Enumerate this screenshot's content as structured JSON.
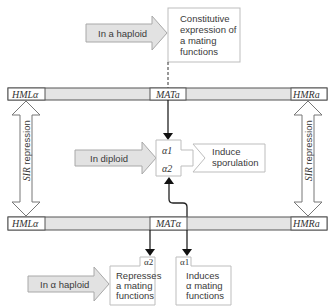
{
  "diagram": {
    "top_input": {
      "label": "In a haploid"
    },
    "top_output": {
      "lines": [
        "Constitutive",
        "expression of",
        "a mating",
        "functions"
      ]
    },
    "top_bar": {
      "left": "HMLα",
      "center": "MATa",
      "right": "HMRa"
    },
    "bottom_bar": {
      "left": "HMLα",
      "center": "MATα",
      "right": "HMRa"
    },
    "repression_left": {
      "label_italic": "SIR",
      "label_rest": " repression"
    },
    "repression_right": {
      "label_italic": "SIR",
      "label_rest": " repression"
    },
    "diploid_input": {
      "label": "In diploid"
    },
    "complex": {
      "top": "α1",
      "bottom": "α2"
    },
    "sporulation": {
      "lines": [
        "Induce",
        "sporulation"
      ]
    },
    "bottom_input": {
      "label": "In α haploid"
    },
    "alpha2_box": {
      "tab": "α2",
      "lines": [
        "Represses",
        "a mating",
        "functions"
      ]
    },
    "alpha1_box": {
      "tab": "α1",
      "lines": [
        "Induces",
        "α mating",
        "functions"
      ]
    },
    "colors": {
      "bar_fill": "#e4e4e4",
      "arrow_fill": "#e2e2e2",
      "line": "#222222"
    }
  }
}
